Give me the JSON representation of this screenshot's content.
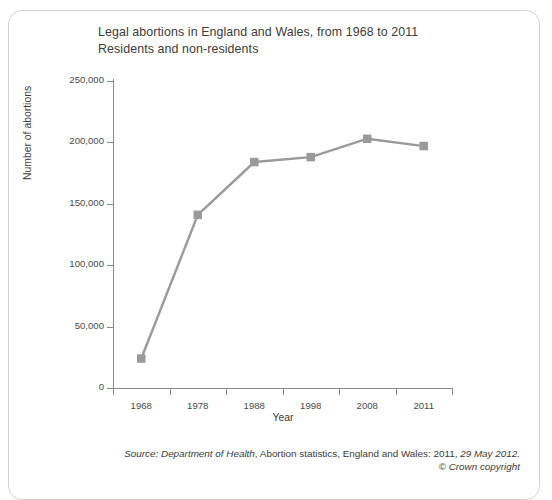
{
  "chart_data": {
    "type": "line",
    "title_lines": [
      "Legal abortions in England and Wales, from 1968 to 2011",
      "Residents and non-residents"
    ],
    "categories": [
      "1968",
      "1978",
      "1988",
      "1998",
      "2008",
      "2011"
    ],
    "values": [
      24000,
      141000,
      184000,
      188000,
      203000,
      197000
    ],
    "xlabel": "Year",
    "ylabel": "Number of abortions",
    "ylim": [
      0,
      250000
    ],
    "ytick_labels": [
      "0",
      "50,000",
      "100,000",
      "150,000",
      "200,000",
      "250,000"
    ],
    "ytick_values": [
      0,
      50000,
      100000,
      150000,
      200000,
      250000
    ],
    "grid": false,
    "legend": "none",
    "series_color": "#9a9a9a",
    "marker": "square"
  },
  "footer": {
    "source_italic_prefix": "Source: Department of Health",
    "source_middle": ", Abortion statistics, England and Wales: 2011, ",
    "source_italic_date": "29 May 2012.",
    "copyright": "© Crown copyright"
  }
}
